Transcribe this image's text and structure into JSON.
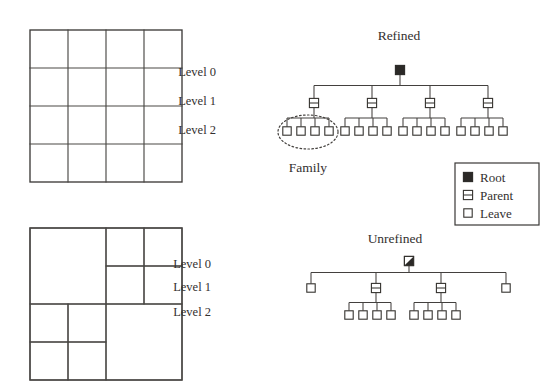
{
  "figure": {
    "background": "#ffffff",
    "ink": "#33302f",
    "grids": {
      "refined_grid": {
        "name": "uniform-refined-mesh",
        "x": 30,
        "y": 30,
        "size": 152,
        "divisions": 4,
        "description": "uniform 4 by 4 cartesian grid"
      },
      "unrefined_grid": {
        "name": "adaptive-unrefined-mesh",
        "x": 30,
        "y": 228,
        "size": 152,
        "description": "quadtree mesh with mixed refinement levels",
        "cells": [
          {
            "label": "top-left-coarse",
            "x": 0.0,
            "y": 0.0,
            "w": 0.5,
            "h": 0.5
          },
          {
            "label": "bottom-right-coarse",
            "x": 0.5,
            "y": 0.5,
            "w": 0.5,
            "h": 0.5
          },
          {
            "label": "tr-q1",
            "x": 0.5,
            "y": 0.0,
            "w": 0.25,
            "h": 0.25
          },
          {
            "label": "tr-q2",
            "x": 0.75,
            "y": 0.0,
            "w": 0.25,
            "h": 0.25
          },
          {
            "label": "tr-q3",
            "x": 0.5,
            "y": 0.25,
            "w": 0.25,
            "h": 0.25
          },
          {
            "label": "tr-q4",
            "x": 0.75,
            "y": 0.25,
            "w": 0.25,
            "h": 0.25
          },
          {
            "label": "bl-q1",
            "x": 0.0,
            "y": 0.5,
            "w": 0.25,
            "h": 0.25
          },
          {
            "label": "bl-q2",
            "x": 0.25,
            "y": 0.5,
            "w": 0.25,
            "h": 0.25
          },
          {
            "label": "bl-q3",
            "x": 0.0,
            "y": 0.75,
            "w": 0.25,
            "h": 0.25
          },
          {
            "label": "bl-q4",
            "x": 0.25,
            "y": 0.75,
            "w": 0.25,
            "h": 0.25
          }
        ]
      }
    },
    "trees": {
      "refined": {
        "title": "Refined",
        "title_x": 399,
        "title_y": 40,
        "levels": [
          {
            "label": "Level 0",
            "x": 216,
            "y": 76,
            "node_y": 70
          },
          {
            "label": "Level 1",
            "x": 216,
            "y": 105,
            "node_y": 103
          },
          {
            "label": "Level 2",
            "x": 216,
            "y": 134,
            "node_y": 131
          }
        ],
        "root": {
          "type": "root",
          "x": 400
        },
        "parents_x": [
          314,
          343,
          372,
          401,
          430,
          459,
          488
        ],
        "parent_nodes": [
          {
            "x": 314,
            "children_x": [
              287,
              301,
              315,
              329
            ]
          },
          {
            "x": 372,
            "children_x": [
              345,
              359,
              373,
              387
            ]
          },
          {
            "x": 430,
            "children_x": [
              403,
              417,
              431,
              445
            ]
          },
          {
            "x": 488,
            "children_x": [
              461,
              475,
              489,
              503
            ]
          }
        ],
        "family": {
          "label": "Family",
          "label_x": 308,
          "label_y": 172,
          "cx": 308,
          "cy": 132,
          "rx": 30,
          "ry": 17
        }
      },
      "unrefined": {
        "title": "Unrefined",
        "title_x": 395,
        "title_y": 243,
        "levels": [
          {
            "label": "Level 0",
            "x": 211,
            "y": 268,
            "node_y": 261
          },
          {
            "label": "Level 1",
            "x": 211,
            "y": 291,
            "node_y": 288
          },
          {
            "label": "Level 2",
            "x": 211,
            "y": 316,
            "node_y": 315
          }
        ],
        "root": {
          "type": "root-partial",
          "x": 409
        },
        "level1": [
          {
            "type": "leaf",
            "x": 311,
            "children_x": []
          },
          {
            "type": "parent",
            "x": 376,
            "children_x": [
              349,
              363,
              377,
              391
            ]
          },
          {
            "type": "parent",
            "x": 441,
            "children_x": [
              414,
              428,
              442,
              456
            ]
          },
          {
            "type": "leaf",
            "x": 506,
            "children_x": []
          }
        ]
      }
    },
    "legend": {
      "name": "node-type-legend",
      "x": 455,
      "y": 163,
      "w": 84,
      "h": 62,
      "items": [
        {
          "symbol": "root",
          "label": "Root"
        },
        {
          "symbol": "parent",
          "label": "Parent"
        },
        {
          "symbol": "leave",
          "label": "Leave"
        }
      ]
    }
  }
}
